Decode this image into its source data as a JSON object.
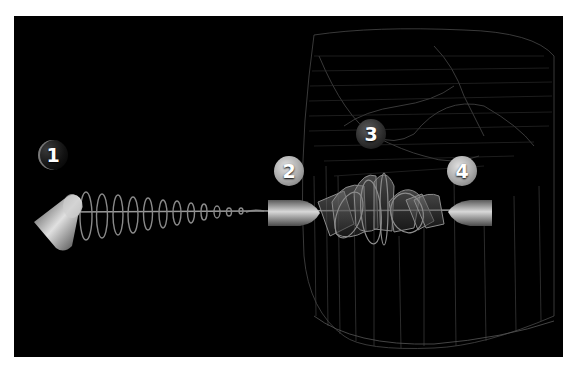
{
  "diagram": {
    "background_color": "#000000",
    "frame_color": "#ffffff",
    "line_color": "#9a9a9a",
    "labels": [
      {
        "id": 1,
        "text": "1",
        "component": "emitter",
        "x": 52,
        "y": 152,
        "style": "ghost"
      },
      {
        "id": 2,
        "text": "2",
        "component": "first-cylinder",
        "x": 289,
        "y": 168,
        "style": "light"
      },
      {
        "id": 3,
        "text": "3",
        "component": "overlapping-filters",
        "x": 370,
        "y": 131,
        "style": "dark"
      },
      {
        "id": 4,
        "text": "4",
        "component": "second-cylinder",
        "x": 462,
        "y": 168,
        "style": "light"
      }
    ]
  }
}
